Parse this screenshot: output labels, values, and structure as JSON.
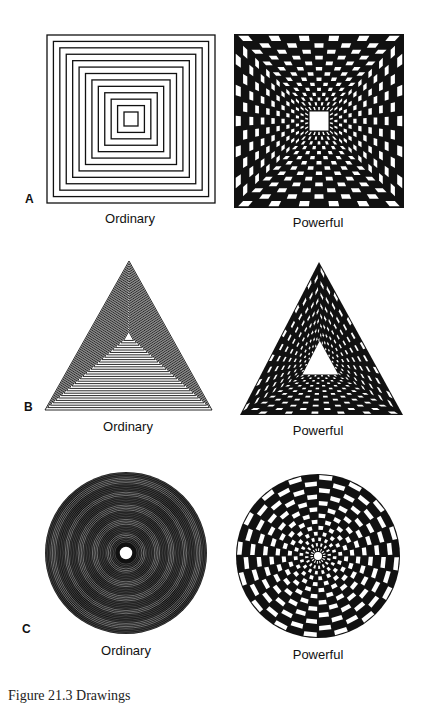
{
  "figure": {
    "caption": "Figure 21.3   Drawings",
    "colors": {
      "ink": "#111111",
      "paper": "#ffffff"
    },
    "rows": [
      {
        "letter": "A",
        "shape": "square",
        "ordinary": {
          "label": "Ordinary",
          "style": "concentric-outlines"
        },
        "powerful": {
          "label": "Powerful",
          "style": "checkerboard-tunnel"
        }
      },
      {
        "letter": "B",
        "shape": "triangle",
        "ordinary": {
          "label": "Ordinary",
          "style": "concentric-outlines"
        },
        "powerful": {
          "label": "Powerful",
          "style": "checkerboard-tunnel"
        }
      },
      {
        "letter": "C",
        "shape": "circle",
        "ordinary": {
          "label": "Ordinary",
          "style": "concentric-rings"
        },
        "powerful": {
          "label": "Powerful",
          "style": "radial-checkerboard"
        }
      }
    ]
  }
}
